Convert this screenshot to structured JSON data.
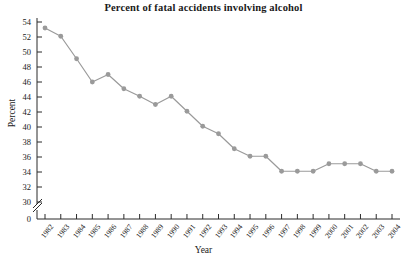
{
  "chart_data": {
    "type": "line",
    "title": "Percent of fatal accidents involving alcohol",
    "xlabel": "Year",
    "ylabel": "Percent",
    "x": [
      1982,
      1983,
      1984,
      1985,
      1986,
      1987,
      1988,
      1989,
      1990,
      1991,
      1992,
      1993,
      1994,
      1995,
      1996,
      1997,
      1998,
      1999,
      2000,
      2001,
      2002,
      2003,
      2004
    ],
    "values": [
      53.2,
      52.1,
      49.1,
      46.0,
      47.0,
      45.1,
      44.1,
      43.0,
      44.1,
      42.1,
      40.1,
      39.1,
      37.1,
      36.1,
      36.1,
      34.1,
      34.1,
      34.1,
      35.1,
      35.1,
      35.1,
      34.1,
      34.1
    ],
    "xtick_labels": [
      "1982",
      "1983",
      "1984",
      "1985",
      "1986",
      "1987",
      "1988",
      "1989",
      "1990",
      "1991",
      "1992",
      "1993",
      "1994",
      "1995",
      "1996",
      "1997",
      "1998",
      "1999",
      "2000",
      "2001",
      "2002",
      "2003",
      "2004"
    ],
    "ytick_labels": [
      "54",
      "52",
      "50",
      "48",
      "46",
      "44",
      "42",
      "40",
      "38",
      "36",
      "34",
      "32",
      "30",
      "0"
    ],
    "ytick_values": [
      54,
      52,
      50,
      48,
      46,
      44,
      42,
      40,
      38,
      36,
      34,
      32,
      30,
      0
    ],
    "ylim": [
      30,
      54
    ],
    "xlim": [
      1982,
      2004
    ],
    "axis_break": true,
    "axis_break_between": [
      30,
      0
    ],
    "grid": false,
    "legend": null,
    "marker": "circle",
    "series_color": "#9a9a9a",
    "axis_color": "#2b2b2b",
    "background_color": "#ffffff"
  }
}
